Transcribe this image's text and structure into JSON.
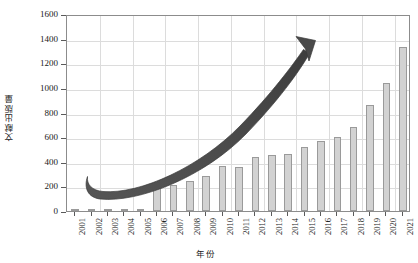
{
  "chart_data": {
    "type": "bar",
    "title": "",
    "xlabel": "年份",
    "ylabel": "文献出版量",
    "categories": [
      "2001",
      "2002",
      "2003",
      "2004",
      "2005",
      "2006",
      "2007",
      "2008",
      "2009",
      "2010",
      "2011",
      "2012",
      "2013",
      "2014",
      "2015",
      "2016",
      "2017",
      "2018",
      "2019",
      "2020",
      "2021"
    ],
    "values": [
      5,
      8,
      5,
      10,
      8,
      190,
      215,
      245,
      285,
      365,
      355,
      440,
      455,
      465,
      520,
      570,
      600,
      680,
      860,
      1040,
      1300
    ],
    "values_note": "Final category 2021 drawn at 1330",
    "ylim": [
      0,
      1600
    ],
    "yticks": [
      0,
      200,
      400,
      600,
      800,
      1000,
      1200,
      1400,
      1600
    ],
    "ytick_labels": [
      "0",
      "200",
      "400",
      "600",
      "800",
      "1000",
      "1200",
      "1400",
      "1600"
    ],
    "grid": true,
    "legend": "none",
    "annotations": [
      {
        "type": "curved-arrow",
        "label": "growth-trend-arrow",
        "direction": "up-right",
        "color": "#4a4a4a"
      }
    ],
    "series": [
      {
        "name": "文献出版量",
        "values": [
          5,
          8,
          5,
          10,
          8,
          190,
          215,
          245,
          285,
          365,
          355,
          440,
          455,
          465,
          520,
          570,
          600,
          680,
          860,
          1040,
          1330
        ],
        "color": "#d2d2d2",
        "edge_color": "#9a9a9a"
      }
    ]
  },
  "colors": {
    "bar_fill": "#d2d2d2",
    "bar_edge": "#9a9a9a",
    "grid": "#dcdcdc",
    "axis": "#8c8c8c",
    "text": "#1a1a1a",
    "arrow": "#4a4a4a"
  }
}
